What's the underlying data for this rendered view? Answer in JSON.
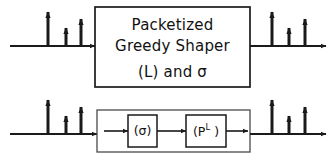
{
  "figure": {
    "stroke_color": "#1a1a1a",
    "background_color": "#ffffff"
  },
  "top_row": {
    "main_block": {
      "line1": "Packetized",
      "line2": "Greedy Shaper",
      "line3": "(L) and σ",
      "box": {
        "x": 95,
        "y": 7,
        "w": 155,
        "h": 80
      }
    },
    "input_signal": {
      "name": "input-impulse-train",
      "baseline_y": 46,
      "axis_x1": 10,
      "axis_x2": 95,
      "impulses": [
        {
          "x": 48,
          "height": 34
        },
        {
          "x": 66,
          "height": 18
        },
        {
          "x": 81,
          "height": 27
        }
      ]
    },
    "output_signal": {
      "name": "output-impulse-train",
      "baseline_y": 46,
      "axis_x1": 250,
      "axis_x2": 326,
      "impulses": [
        {
          "x": 272,
          "height": 34
        },
        {
          "x": 289,
          "height": 18
        },
        {
          "x": 305,
          "height": 27
        }
      ]
    }
  },
  "bottom_row": {
    "outer_block": {
      "name": "cascade-block",
      "box": {
        "x": 97,
        "y": 110,
        "w": 153,
        "h": 42
      }
    },
    "stage_1": {
      "label": "(σ)",
      "box": {
        "x": 128,
        "y": 115,
        "w": 29,
        "h": 32
      }
    },
    "stage_2": {
      "label_base": "(P",
      "label_sup": "L",
      "label_close": " )",
      "box": {
        "x": 186,
        "y": 115,
        "w": 40,
        "h": 32
      }
    },
    "input_signal": {
      "name": "input-impulse-train",
      "baseline_y": 134,
      "axis_x1": 10,
      "axis_x2": 97,
      "impulses": [
        {
          "x": 48,
          "height": 34
        },
        {
          "x": 66,
          "height": 18
        },
        {
          "x": 81,
          "height": 27
        }
      ]
    },
    "output_signal": {
      "name": "output-impulse-train",
      "baseline_y": 134,
      "axis_x1": 250,
      "axis_x2": 326,
      "impulses": [
        {
          "x": 272,
          "height": 34
        },
        {
          "x": 289,
          "height": 18
        },
        {
          "x": 305,
          "height": 27
        }
      ]
    },
    "internal_links": [
      {
        "from_x": 104,
        "to_x": 128
      },
      {
        "from_x": 157,
        "to_x": 186
      },
      {
        "from_x": 226,
        "to_x": 248
      }
    ]
  }
}
